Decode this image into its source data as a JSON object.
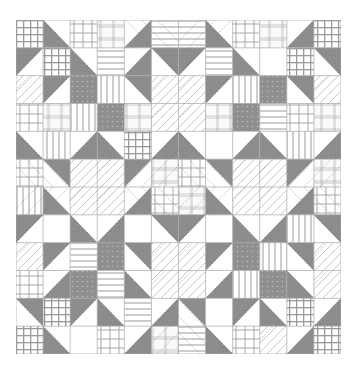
{
  "image": {
    "description": "Quilt pattern: four gray X-star blocks with diamond-in-square centers, assorted plaid/stripe/dot squares",
    "grid": {
      "rows": 12,
      "cols": 12
    },
    "colors": {
      "gray": "#8c8c8c",
      "gray_dark": "#7a7a7a",
      "white": "#ffffff",
      "line": "#b5b5b5",
      "stitch": "#555555"
    },
    "legend_codes": {
      "P": "plaid",
      "G": "grid",
      "S": "horizontal-stripe",
      "V": "vertical-stripe",
      "D": "gray-dots",
      "W": "white",
      "L": "light-plaid",
      "X": "diagonal-lines",
      "a": "half-square gray bottom-left",
      "b": "half-square gray bottom-right",
      "c": "half-square gray top-left",
      "d": "half-square gray top-right"
    },
    "cells": [
      [
        "G",
        "a",
        "P",
        "L",
        "b",
        "S",
        "S",
        "a",
        "P",
        "L",
        "b",
        "G"
      ],
      [
        "c",
        "G",
        "a",
        "S",
        "b",
        "d",
        "c",
        "S",
        "a",
        "W",
        "G",
        "d"
      ],
      [
        "X",
        "c",
        "D",
        "V",
        "d",
        "X",
        "X",
        "c",
        "V",
        "D",
        "d",
        "X"
      ],
      [
        "P",
        "L",
        "V",
        "D",
        "L",
        "X",
        "X",
        "L",
        "D",
        "S",
        "P",
        "L"
      ],
      [
        "a",
        "V",
        "b",
        "a",
        "G",
        "b",
        "a",
        "W",
        "b",
        "a",
        "V",
        "b"
      ],
      [
        "P",
        "d",
        "X",
        "X",
        "c",
        "L",
        "P",
        "d",
        "X",
        "X",
        "c",
        "L"
      ],
      [
        "V",
        "a",
        "X",
        "X",
        "b",
        "P",
        "L",
        "a",
        "X",
        "X",
        "b",
        "P"
      ],
      [
        "c",
        "W",
        "a",
        "b",
        "W",
        "d",
        "c",
        "W",
        "a",
        "b",
        "V",
        "d"
      ],
      [
        "X",
        "c",
        "S",
        "D",
        "d",
        "X",
        "X",
        "c",
        "D",
        "V",
        "d",
        "X"
      ],
      [
        "P",
        "b",
        "D",
        "S",
        "a",
        "X",
        "X",
        "b",
        "V",
        "D",
        "a",
        "X"
      ],
      [
        "d",
        "G",
        "c",
        "a",
        "S",
        "b",
        "d",
        "W",
        "c",
        "a",
        "G",
        "b"
      ],
      [
        "G",
        "a",
        "W",
        "P",
        "b",
        "L",
        "S",
        "a",
        "P",
        "X",
        "b",
        "G"
      ]
    ]
  }
}
